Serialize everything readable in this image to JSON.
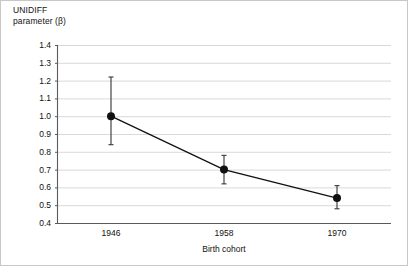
{
  "chart_data": {
    "type": "line",
    "title": "",
    "ylabel": "UNIDIFF\nparameter (β)",
    "xlabel": "Birth cohort",
    "categories": [
      "1946",
      "1958",
      "1970"
    ],
    "values": [
      1.0,
      0.7,
      0.54
    ],
    "error_low": [
      0.84,
      0.62,
      0.48
    ],
    "error_high": [
      1.22,
      0.78,
      0.61
    ],
    "ylim": [
      0.4,
      1.4
    ],
    "yticks": [
      "1.4",
      "1.3",
      "1.2",
      "1.1",
      "1.0",
      "0.9",
      "0.8",
      "0.7",
      "0.6",
      "0.5",
      "0.4"
    ],
    "ytick_values": [
      1.4,
      1.3,
      1.2,
      1.1,
      1.0,
      0.9,
      0.8,
      0.7,
      0.6,
      0.5,
      0.4
    ],
    "grid": true,
    "legend": "none",
    "series": [
      {
        "name": "UNIDIFF parameter",
        "values": [
          1.0,
          0.7,
          0.54
        ]
      }
    ],
    "marker_color": "#111111",
    "line_color": "#111111",
    "grid_color": "#c9c9c9",
    "axis_color": "#5a5a5a"
  }
}
